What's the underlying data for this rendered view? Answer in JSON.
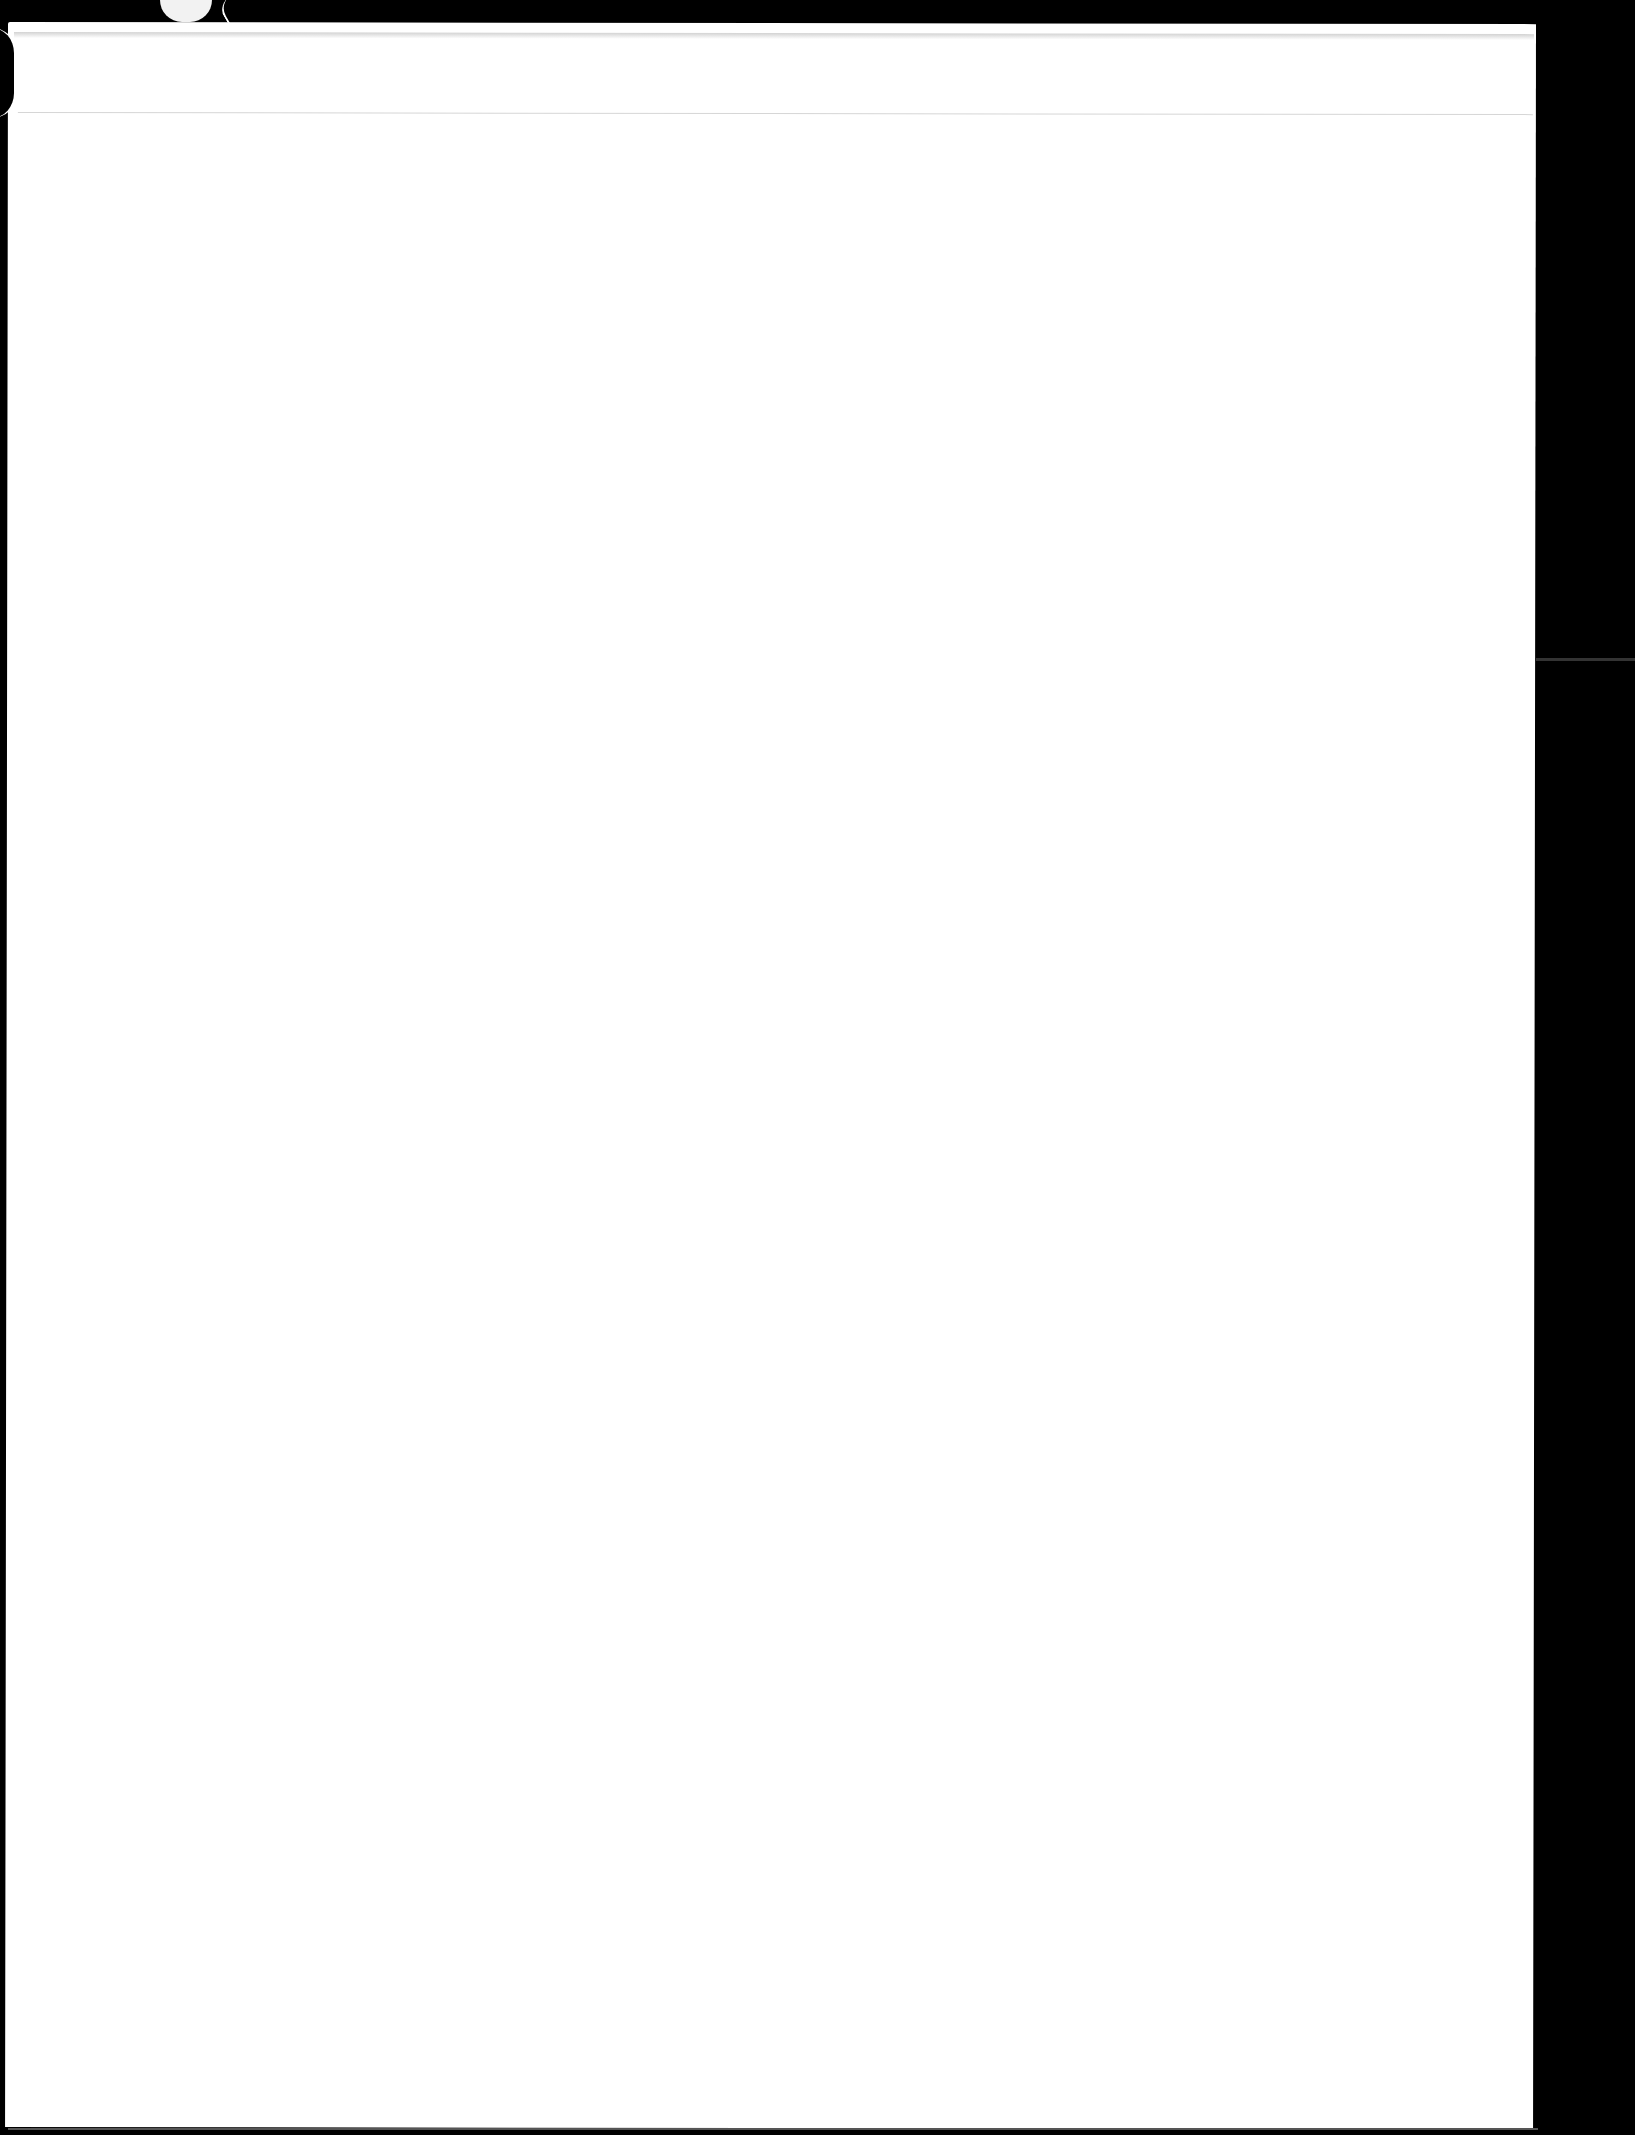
{
  "document": {
    "type": "scanned-page",
    "content": "",
    "colors": {
      "page": "#ffffff",
      "background": "#000000",
      "fold_line": "#d6d6d6"
    }
  }
}
